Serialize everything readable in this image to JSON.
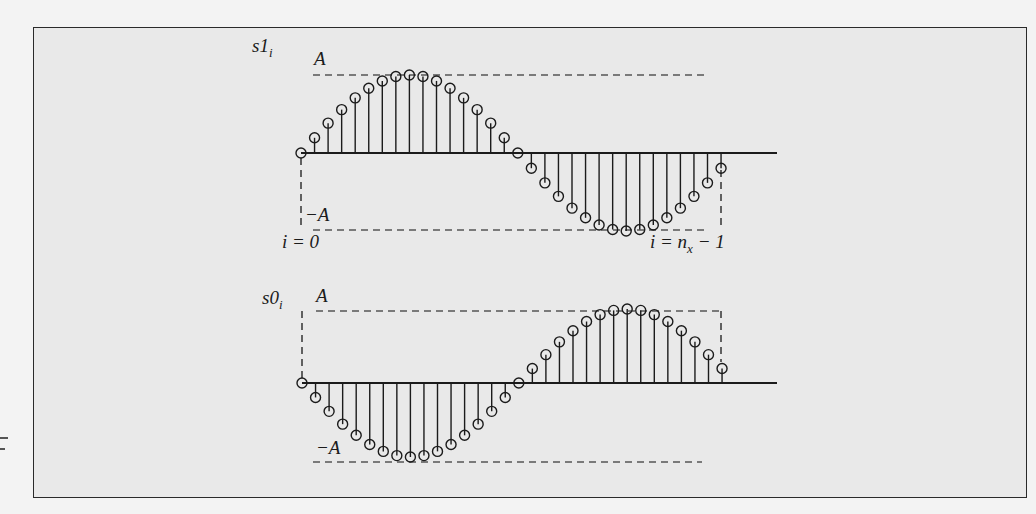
{
  "figure": {
    "n_x": 32,
    "amplitude_symbol": "A"
  },
  "plots": [
    {
      "id": "s1",
      "signal_label_base": "s1",
      "signal_label_sub": "i",
      "upper_bound_label": "A",
      "lower_bound_label": "−A",
      "start_label": "i = 0",
      "end_label_prefix": "i = n",
      "end_label_sub": "x",
      "end_label_suffix": " − 1",
      "formula": "A·sin(2πi/n_x)",
      "sign": 1
    },
    {
      "id": "s0",
      "signal_label_base": "s0",
      "signal_label_sub": "i",
      "upper_bound_label": "A",
      "lower_bound_label": "−A",
      "formula": "−A·sin(2πi/n_x)",
      "sign": -1
    }
  ],
  "chart_data": [
    {
      "type": "stem",
      "title": "s1_i",
      "x": [
        0,
        1,
        2,
        3,
        4,
        5,
        6,
        7,
        8,
        9,
        10,
        11,
        12,
        13,
        14,
        15,
        16,
        17,
        18,
        19,
        20,
        21,
        22,
        23,
        24,
        25,
        26,
        27,
        28,
        29,
        30,
        31
      ],
      "values": [
        0.0,
        0.195,
        0.383,
        0.556,
        0.707,
        0.831,
        0.924,
        0.981,
        1.0,
        0.981,
        0.924,
        0.831,
        0.707,
        0.556,
        0.383,
        0.195,
        0.0,
        -0.195,
        -0.383,
        -0.556,
        -0.707,
        -0.831,
        -0.924,
        -0.981,
        -1.0,
        -0.981,
        -0.924,
        -0.831,
        -0.707,
        -0.556,
        -0.383,
        -0.195
      ],
      "ylim": [
        -1,
        1
      ],
      "ylabel": "s1_i (units of A)",
      "annotations": [
        "A",
        "−A",
        "i = 0",
        "i = n_x − 1"
      ],
      "grid": false
    },
    {
      "type": "stem",
      "title": "s0_i",
      "x": [
        0,
        1,
        2,
        3,
        4,
        5,
        6,
        7,
        8,
        9,
        10,
        11,
        12,
        13,
        14,
        15,
        16,
        17,
        18,
        19,
        20,
        21,
        22,
        23,
        24,
        25,
        26,
        27,
        28,
        29,
        30,
        31
      ],
      "values": [
        0.0,
        -0.195,
        -0.383,
        -0.556,
        -0.707,
        -0.831,
        -0.924,
        -0.981,
        -1.0,
        -0.981,
        -0.924,
        -0.831,
        -0.707,
        -0.556,
        -0.383,
        -0.195,
        0.0,
        0.195,
        0.383,
        0.556,
        0.707,
        0.831,
        0.924,
        0.981,
        1.0,
        0.981,
        0.924,
        0.831,
        0.707,
        0.556,
        0.383,
        0.195
      ],
      "ylim": [
        -1,
        1
      ],
      "ylabel": "s0_i (units of A)",
      "annotations": [
        "A",
        "−A"
      ],
      "grid": false
    }
  ]
}
